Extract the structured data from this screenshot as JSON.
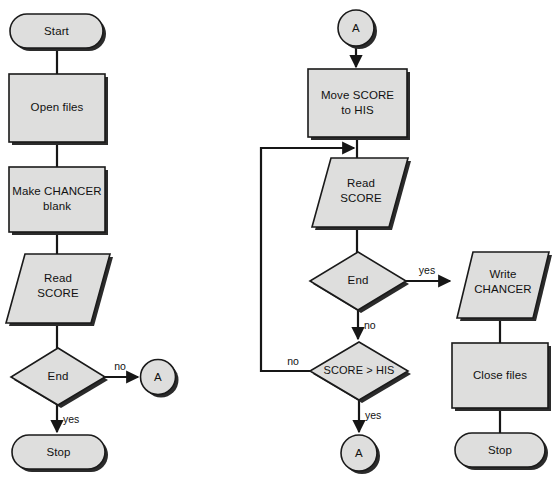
{
  "diagram": {
    "colors": {
      "shape_fill": "#dededd",
      "shape_stroke": "#1a1a1a",
      "shadow": "#2b2b2b",
      "connector": "#161616",
      "background": "#ffffff",
      "text": "#111111"
    },
    "left_flow": {
      "nodes": [
        {
          "id": "start",
          "type": "terminator",
          "label": "Start"
        },
        {
          "id": "open-files",
          "type": "process",
          "label": "Open files"
        },
        {
          "id": "make-chancer-blank",
          "type": "process",
          "label_line1": "Make CHANCER",
          "label_line2": "blank"
        },
        {
          "id": "read-score",
          "type": "io",
          "label_line1": "Read",
          "label_line2": "SCORE"
        },
        {
          "id": "end-decision",
          "type": "decision",
          "label": "End"
        },
        {
          "id": "connector-a",
          "type": "connector",
          "label": "A"
        },
        {
          "id": "stop",
          "type": "terminator",
          "label": "Stop"
        }
      ],
      "edge_labels": {
        "end_no": "no",
        "end_yes": "yes"
      }
    },
    "right_flow": {
      "nodes": [
        {
          "id": "connector-a-top",
          "type": "connector",
          "label": "A"
        },
        {
          "id": "move-score-to-his",
          "type": "process",
          "label_line1": "Move SCORE",
          "label_line2": "to HIS"
        },
        {
          "id": "read-score",
          "type": "io",
          "label_line1": "Read",
          "label_line2": "SCORE"
        },
        {
          "id": "end-decision",
          "type": "decision",
          "label": "End"
        },
        {
          "id": "score-gt-his-decision",
          "type": "decision",
          "label": "SCORE > HIS"
        },
        {
          "id": "write-chancer",
          "type": "io",
          "label_line1": "Write",
          "label_line2": "CHANCER"
        },
        {
          "id": "close-files",
          "type": "process",
          "label": "Close files"
        },
        {
          "id": "stop",
          "type": "terminator",
          "label": "Stop"
        },
        {
          "id": "connector-a-bottom",
          "type": "connector",
          "label": "A"
        }
      ],
      "edge_labels": {
        "end_yes": "yes",
        "end_no": "no",
        "score_no": "no",
        "score_yes": "yes"
      }
    }
  }
}
